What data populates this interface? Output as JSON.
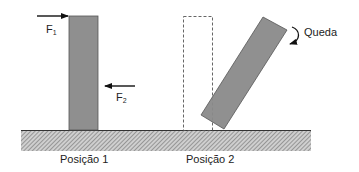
{
  "diagram": {
    "labels": {
      "f1_main": "F",
      "f1_sub": "1",
      "f2_main": "F",
      "f2_sub": "2",
      "fall": "Queda",
      "position1": "Posição 1",
      "position2": "Posição 2"
    },
    "colors": {
      "block_fill": "#8f8f8f",
      "block_stroke": "#555555",
      "tilted_fill": "#8a8a8a",
      "ground_fill": "#c9c9c9",
      "hatch": "#6f6f6f",
      "ground_line": "#333333",
      "arrow": "#111111",
      "dashed": "#555555"
    }
  }
}
